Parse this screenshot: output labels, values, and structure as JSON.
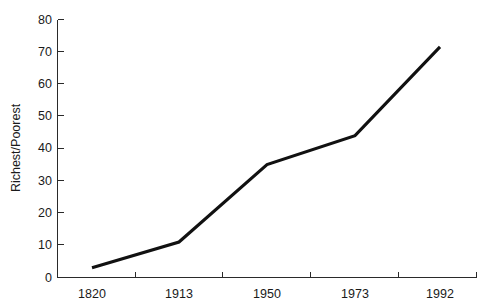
{
  "chart_data": {
    "type": "line",
    "title": "",
    "subtitle": "",
    "xlabel": "",
    "ylabel": "Richest/Poorest",
    "categories": [
      "1820",
      "1913",
      "1950",
      "1973",
      "1992"
    ],
    "values": [
      3,
      11,
      35,
      44,
      71.5
    ],
    "series": [
      {
        "name": "Richest/Poorest",
        "values": [
          3,
          11,
          35,
          44,
          71.5
        ],
        "color": "#111111"
      }
    ],
    "ylim": [
      0,
      80
    ],
    "y_ticks": [
      0,
      10,
      20,
      30,
      40,
      50,
      60,
      70,
      80
    ],
    "y_tick_labels": [
      "0",
      "10",
      "20",
      "30",
      "40",
      "50",
      "60",
      "70",
      "80"
    ],
    "x_tick_labels": [
      "1820",
      "1913",
      "1950",
      "1973",
      "1992"
    ],
    "grid": false,
    "legend": false,
    "legend_position": "none",
    "markers": false,
    "background_color": "#ffffff",
    "axis_color": "#2a2a2a",
    "text_color": "#1a1a1a",
    "line_color": "#111111",
    "annotations": []
  },
  "figure": {
    "width": 494,
    "height": 308
  }
}
